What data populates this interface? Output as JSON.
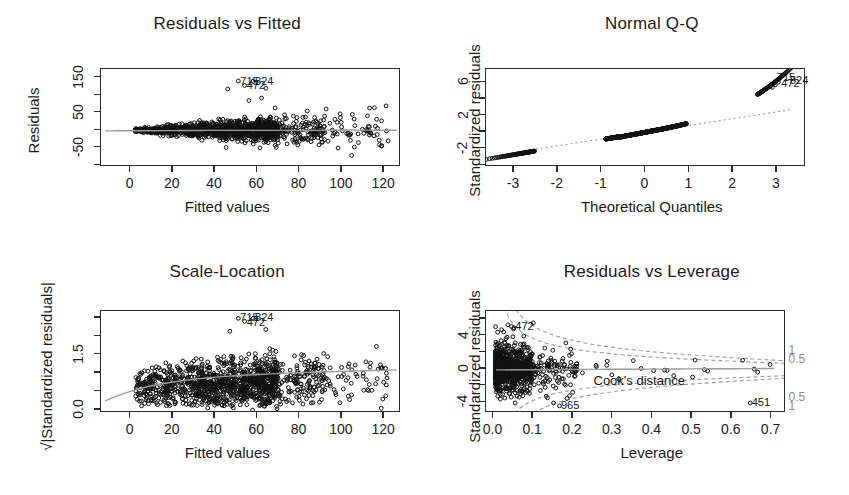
{
  "figure": {
    "kind": "regression-diagnostic-plots",
    "background": "#ffffff",
    "foreground": "#1a1a1a",
    "smooth_color": "#9a9a9a",
    "point_color": "#111111"
  },
  "chart_data": [
    {
      "id": "residuals-vs-fitted",
      "type": "scatter",
      "title": "Residuals vs Fitted",
      "xlabel": "Fitted values",
      "ylabel": "Residuals",
      "xticks": [
        0,
        20,
        40,
        60,
        80,
        100,
        120
      ],
      "xtick_labels": [
        "0",
        "20",
        "40",
        "60",
        "80",
        "100",
        "120"
      ],
      "yticks": [
        -50,
        50,
        150
      ],
      "ytick_labels": [
        "-50",
        "50",
        "150"
      ],
      "yticks_minor": [
        -100,
        0,
        100
      ],
      "xlim": [
        -14,
        128
      ],
      "ylim": [
        -105,
        175
      ],
      "grid": false,
      "legend": "none",
      "reference_line": {
        "type": "loess-smooth",
        "y_approx": 0
      },
      "annotations": [
        {
          "label": "715",
          "x": 51,
          "y": 141
        },
        {
          "label": "824",
          "x": 58,
          "y": 141
        },
        {
          "label": "472",
          "x": 54,
          "y": 130
        }
      ],
      "n_points_approx": 1200,
      "description": "Residuals fan out with increasing fitted values; flat grey loess line near zero."
    },
    {
      "id": "normal-qq",
      "type": "scatter",
      "title": "Normal Q-Q",
      "xlabel": "Theoretical Quantiles",
      "ylabel": "Standardized residuals",
      "xticks": [
        -3,
        -2,
        -1,
        0,
        1,
        2,
        3
      ],
      "xtick_labels": [
        "-3",
        "-2",
        "-1",
        "0",
        "1",
        "2",
        "3"
      ],
      "yticks": [
        -2,
        2,
        6
      ],
      "ytick_labels": [
        "-2",
        "2",
        "6"
      ],
      "yticks_minor": [
        -4,
        0,
        4
      ],
      "xlim": [
        -3.65,
        3.65
      ],
      "ylim": [
        -4.2,
        7.6
      ],
      "grid": false,
      "legend": "none",
      "reference_line": {
        "type": "qq-identity",
        "style": "dotted"
      },
      "annotations": [
        {
          "label": "715",
          "x": 2.95,
          "y": 6.6
        },
        {
          "label": "824",
          "x": 3.25,
          "y": 6.3
        },
        {
          "label": "472",
          "x": 3.05,
          "y": 5.9
        }
      ],
      "n_points_approx": 1200,
      "description": "Points curve upward above the dotted reference line at the right tail."
    },
    {
      "id": "scale-location",
      "type": "scatter",
      "title": "Scale-Location",
      "xlabel": "Fitted values",
      "ylabel": "√|Standardized residuals|",
      "xticks": [
        0,
        20,
        40,
        60,
        80,
        100,
        120
      ],
      "xtick_labels": [
        "0",
        "20",
        "40",
        "60",
        "80",
        "100",
        "120"
      ],
      "yticks": [
        0.0,
        1.5
      ],
      "ytick_labels": [
        "0.0",
        "1.5"
      ],
      "yticks_minor": [
        0.5,
        1.0,
        2.0,
        2.5
      ],
      "xlim": [
        -14,
        128
      ],
      "ylim": [
        -0.07,
        2.7
      ],
      "grid": false,
      "legend": "none",
      "reference_line": {
        "type": "loess-smooth"
      },
      "annotations": [
        {
          "label": "715",
          "x": 51,
          "y": 2.52
        },
        {
          "label": "824",
          "x": 58,
          "y": 2.52
        },
        {
          "label": "472",
          "x": 54,
          "y": 2.38
        }
      ],
      "n_points_approx": 1200,
      "description": "Square-root of absolute standardized residuals rising gently with fitted values."
    },
    {
      "id": "residuals-vs-leverage",
      "type": "scatter",
      "title": "Residuals vs Leverage",
      "xlabel": "Leverage",
      "ylabel": "Standardized residuals",
      "xticks": [
        0.0,
        0.1,
        0.2,
        0.3,
        0.4,
        0.5,
        0.6,
        0.7
      ],
      "xtick_labels": [
        "0.0",
        "0.1",
        "0.2",
        "0.3",
        "0.4",
        "0.5",
        "0.6",
        "0.7"
      ],
      "yticks": [
        -4,
        0,
        4
      ],
      "ytick_labels": [
        "-4",
        "0",
        "4"
      ],
      "yticks_minor": [
        -2,
        2,
        6
      ],
      "xlim": [
        -0.02,
        0.735
      ],
      "ylim": [
        -5.2,
        7.0
      ],
      "grid": false,
      "legend": "Cook's distance",
      "cooks_legend_label": "Cook's distance",
      "cooks_contours": [
        {
          "level": "1",
          "side": "upper"
        },
        {
          "level": "0.5",
          "side": "upper"
        },
        {
          "level": "0.5",
          "side": "lower"
        },
        {
          "level": "1",
          "side": "lower"
        }
      ],
      "annotations": [
        {
          "label": "472",
          "x": 0.05,
          "y": 5.2
        },
        {
          "label": "965",
          "x": 0.165,
          "y": -4.35
        },
        {
          "label": "451",
          "x": 0.645,
          "y": -4.0
        }
      ],
      "n_points_approx": 1200,
      "description": "Dense cluster at low leverage with a few high-leverage points near 0.5-0.7."
    }
  ]
}
